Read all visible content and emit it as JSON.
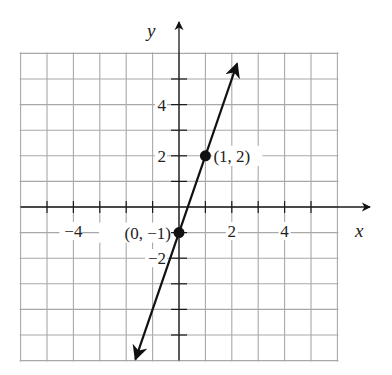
{
  "chart_data": {
    "type": "line",
    "title": "",
    "xlabel": "x",
    "ylabel": "y",
    "xlim": [
      -6,
      6
    ],
    "ylim": [
      -6,
      6
    ],
    "grid": true,
    "x_tick_labels": [
      "-4",
      "2",
      "4"
    ],
    "y_tick_labels": [
      "4",
      "2",
      "-2"
    ],
    "series": [
      {
        "name": "y = 3x - 1",
        "slope": 3,
        "intercept": -1,
        "x": [
          -1.65,
          2.2
        ],
        "y": [
          -5.95,
          5.6
        ],
        "arrows": "both"
      }
    ],
    "points": [
      {
        "x": 0,
        "y": -1,
        "label": "(0, −1)"
      },
      {
        "x": 1,
        "y": 2,
        "label": "(1, 2)"
      }
    ]
  },
  "labels": {
    "x_axis": "x",
    "y_axis": "y",
    "x_ticks": [
      {
        "value": -4,
        "text": "−4"
      },
      {
        "value": 2,
        "text": "2"
      },
      {
        "value": 4,
        "text": "4"
      }
    ],
    "y_ticks": [
      {
        "value": 4,
        "text": "4"
      },
      {
        "value": 2,
        "text": "2"
      },
      {
        "value": -2,
        "text": "−2"
      }
    ],
    "point_a": "(0, −1)",
    "point_b": "(1, 2)"
  },
  "colors": {
    "grid": "#a8a8a8",
    "axis": "#1a1a1a",
    "line": "#111111",
    "background": "#ffffff"
  }
}
